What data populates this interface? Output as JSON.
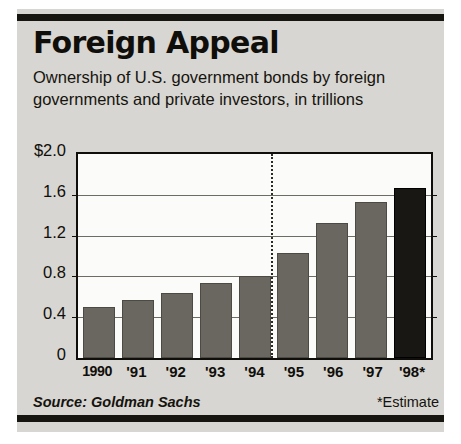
{
  "card": {
    "title": "Foreign Appeal",
    "subtitle": "Ownership of U.S. government bonds by foreign governments and private investors, in trillions",
    "source": "Source: Goldman Sachs",
    "estimate_note": "*Estimate"
  },
  "colors": {
    "card_background": "#d8d6d2",
    "rule": "#17150f",
    "plot_background": "#fbfbfa",
    "bar": "#6a6760",
    "bar_estimate": "#191713",
    "gridline": "#6e6b64",
    "text": "#100e0a"
  },
  "chart_data": {
    "type": "bar",
    "title": "Foreign Appeal",
    "subtitle": "Ownership of U.S. government bonds by foreign governments and private investors, in trillions",
    "categories": [
      "1990",
      "'91",
      "'92",
      "'93",
      "'94",
      "'95",
      "'96",
      "'97",
      "'98*"
    ],
    "values": [
      0.5,
      0.57,
      0.64,
      0.74,
      0.8,
      1.03,
      1.32,
      1.53,
      1.67
    ],
    "xlabel": "",
    "ylabel": "",
    "ylim": [
      0,
      2.0
    ],
    "ytick_values": [
      0,
      0.4,
      0.8,
      1.2,
      1.6,
      2.0
    ],
    "ytick_labels": [
      "0",
      "0.4",
      "0.8",
      "1.2",
      "1.6",
      "$2.0"
    ],
    "grid": true,
    "legend": null,
    "units": "trillions of U.S. dollars",
    "annotations": [
      {
        "type": "vertical-dotted-line",
        "position": "between '95 and '96",
        "meaning": "separator before most recent years"
      },
      {
        "type": "highlighted-bar",
        "category": "'98*",
        "meaning": "estimate, drawn in darker shade"
      }
    ]
  }
}
